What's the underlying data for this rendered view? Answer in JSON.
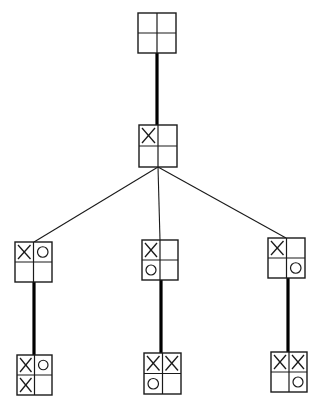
{
  "diagram": {
    "type": "game-tree",
    "colors": {
      "stroke": "#1a1a1a",
      "background": "#ffffff"
    },
    "nodes": [
      {
        "id": "root",
        "label": "empty board",
        "x": 138,
        "y": 13,
        "w": 38,
        "h": 40,
        "cells": [
          "",
          "",
          "",
          ""
        ]
      },
      {
        "id": "n1",
        "label": "X top-left",
        "x": 139,
        "y": 125,
        "w": 38,
        "h": 42,
        "cells": [
          "X",
          "",
          "",
          ""
        ]
      },
      {
        "id": "n1a",
        "label": "X TL, O TR",
        "x": 15,
        "y": 242,
        "w": 37,
        "h": 40,
        "cells": [
          "X",
          "O",
          "",
          ""
        ]
      },
      {
        "id": "n1b",
        "label": "X TL, O BL",
        "x": 142,
        "y": 240,
        "w": 36,
        "h": 40,
        "cells": [
          "X",
          "",
          "O",
          ""
        ]
      },
      {
        "id": "n1c",
        "label": "X TL, O BR",
        "x": 268,
        "y": 238,
        "w": 37,
        "h": 40,
        "cells": [
          "X",
          "",
          "",
          "O"
        ]
      },
      {
        "id": "n1a1",
        "label": "X TL BL, O TR",
        "x": 17,
        "y": 355,
        "w": 35,
        "h": 40,
        "cells": [
          "X",
          "O",
          "X",
          ""
        ]
      },
      {
        "id": "n1b1",
        "label": "X TL TR, O BL",
        "x": 144,
        "y": 353,
        "w": 37,
        "h": 41,
        "cells": [
          "X",
          "X",
          "O",
          ""
        ]
      },
      {
        "id": "n1c1",
        "label": "X TL TR, O BR",
        "x": 271,
        "y": 352,
        "w": 36,
        "h": 40,
        "cells": [
          "X",
          "X",
          "",
          "O"
        ]
      }
    ],
    "edges": [
      {
        "from": "root",
        "to": "n1",
        "style": "thick",
        "x1": 157,
        "y1": 53,
        "x2": 157,
        "y2": 125
      },
      {
        "from": "n1",
        "to": "n1a",
        "style": "thin",
        "x1": 158,
        "y1": 167,
        "x2": 34,
        "y2": 242
      },
      {
        "from": "n1",
        "to": "n1b",
        "style": "thin",
        "x1": 158,
        "y1": 167,
        "x2": 160,
        "y2": 240
      },
      {
        "from": "n1",
        "to": "n1c",
        "style": "thin",
        "x1": 158,
        "y1": 167,
        "x2": 286,
        "y2": 238
      },
      {
        "from": "n1a",
        "to": "n1a1",
        "style": "thick",
        "x1": 34,
        "y1": 282,
        "x2": 34,
        "y2": 355
      },
      {
        "from": "n1b",
        "to": "n1b1",
        "style": "thick",
        "x1": 161,
        "y1": 280,
        "x2": 161,
        "y2": 353
      },
      {
        "from": "n1c",
        "to": "n1c1",
        "style": "thick",
        "x1": 288,
        "y1": 278,
        "x2": 288,
        "y2": 352
      }
    ]
  }
}
